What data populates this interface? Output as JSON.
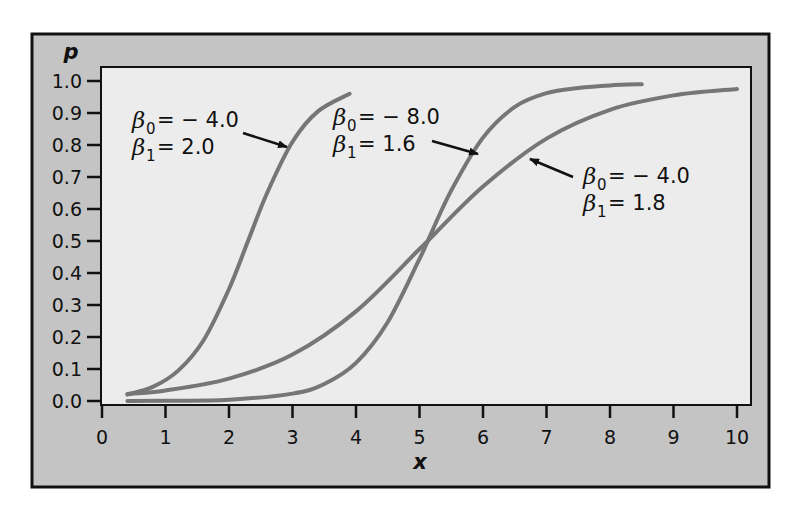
{
  "chart_data": {
    "type": "line",
    "title": "",
    "xlabel": "x",
    "ylabel": "p",
    "xlim": [
      0,
      10
    ],
    "ylim": [
      0.0,
      1.0
    ],
    "x_ticks": [
      "0",
      "1",
      "2",
      "3",
      "4",
      "5",
      "6",
      "7",
      "8",
      "9",
      "10"
    ],
    "y_ticks": [
      "0.0",
      "0.1",
      "0.2",
      "0.3",
      "0.4",
      "0.5",
      "0.6",
      "0.7",
      "0.8",
      "0.9",
      "1.0"
    ],
    "grid": false,
    "legend": null,
    "series": [
      {
        "name": "β0 = −4.0, β1 = 2.0",
        "beta0": -4.0,
        "beta1": 2.0,
        "x": [
          0.4,
          0.8,
          1.2,
          1.6,
          2.0,
          2.3,
          2.6,
          3.0,
          3.4,
          3.9
        ],
        "y": [
          0.02,
          0.044,
          0.095,
          0.19,
          0.35,
          0.5,
          0.65,
          0.81,
          0.905,
          0.96
        ]
      },
      {
        "name": "β0 = −8.0, β1 = 1.6",
        "beta0": -8.0,
        "beta1": 1.6,
        "x": [
          0.4,
          1.0,
          2.0,
          3.0,
          3.5,
          4.0,
          4.5,
          5.0,
          5.13,
          5.5,
          6.0,
          6.5,
          7.0,
          7.5,
          8.0,
          8.5
        ],
        "y": [
          0.0,
          0.001,
          0.004,
          0.023,
          0.053,
          0.119,
          0.247,
          0.444,
          0.5,
          0.658,
          0.823,
          0.919,
          0.962,
          0.978,
          0.986,
          0.99
        ]
      },
      {
        "name": "β0 = −4.0, β1 = 1.8",
        "beta0": -4.0,
        "beta1": 1.8,
        "x": [
          0.4,
          1.0,
          2.0,
          3.0,
          4.0,
          5.0,
          5.13,
          6.0,
          7.0,
          8.0,
          9.0,
          10.0
        ],
        "y": [
          0.022,
          0.033,
          0.07,
          0.145,
          0.28,
          0.475,
          0.5,
          0.67,
          0.82,
          0.91,
          0.955,
          0.975
        ]
      }
    ],
    "annotations": [
      {
        "b0_label": "β",
        "b0_sub": "0",
        "b0_value": "= − 4.0",
        "b1_label": "β",
        "b1_sub": "1",
        "b1_value": "= 2.0",
        "series": 0
      },
      {
        "b0_label": "β",
        "b0_sub": "0",
        "b0_value": "= − 8.0",
        "b1_label": "β",
        "b1_sub": "1",
        "b1_value": "= 1.6",
        "series": 1
      },
      {
        "b0_label": "β",
        "b0_sub": "0",
        "b0_value": "= − 4.0",
        "b1_label": "β",
        "b1_sub": "1",
        "b1_value": "= 1.8",
        "series": 2
      }
    ]
  },
  "style": {
    "frame_fill": "#c4c4c4",
    "plot_fill": "#ececec",
    "curve_color": "#767676",
    "ink": "#111111"
  }
}
